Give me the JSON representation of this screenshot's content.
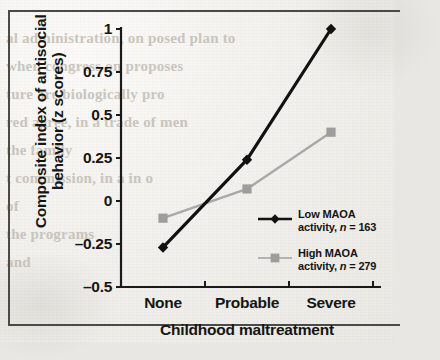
{
  "figure": {
    "background_color": "#f0efeb",
    "ink_color": "#111111",
    "series_colors": {
      "low": "#111111",
      "high": "#a8a8a8"
    }
  },
  "ghost_text": [
    {
      "text": "al administration, on posed plan to",
      "x": 6,
      "y": 30
    },
    {
      "text": "when congress on proposes",
      "x": 6,
      "y": 58
    },
    {
      "text": "ture are biologically pro",
      "x": 6,
      "y": 86
    },
    {
      "text": "red agree, in a trade of men",
      "x": 6,
      "y": 114
    },
    {
      "text": "the family",
      "x": 6,
      "y": 142
    },
    {
      "text": "t commission, in a in o",
      "x": 6,
      "y": 170
    },
    {
      "text": "of",
      "x": 6,
      "y": 198
    },
    {
      "text": "the programs",
      "x": 6,
      "y": 226
    },
    {
      "text": "and",
      "x": 6,
      "y": 254
    }
  ],
  "chart_data": {
    "type": "line",
    "title": "",
    "xlabel": "Childhood maltreatment",
    "ylabel": "Composite index of antisocial behavior (z scores)",
    "categories": [
      "None",
      "Probable",
      "Severe"
    ],
    "ytick_labels": [
      "1",
      "0.75",
      "0.5",
      "0.25",
      "0",
      "–0.25",
      "–0.5"
    ],
    "ytick_values": [
      1,
      0.75,
      0.5,
      0.25,
      0,
      -0.25,
      -0.5
    ],
    "ylim": [
      -0.5,
      1
    ],
    "grid": false,
    "legend_position": "inside-right",
    "series": [
      {
        "name": "Low MAOA activity",
        "legend_line1": "Low MAOA",
        "legend_line2_prefix": "activity, ",
        "legend_line2_italic": "n",
        "legend_line2_suffix": " = 163",
        "n": 163,
        "color": "#111111",
        "marker": "diamond",
        "values": [
          -0.27,
          0.24,
          1.0
        ]
      },
      {
        "name": "High MAOA activity",
        "legend_line1": "High MAOA",
        "legend_line2_prefix": "activity, ",
        "legend_line2_italic": "n",
        "legend_line2_suffix": " = 279",
        "n": 279,
        "color": "#a8a8a8",
        "marker": "square",
        "values": [
          -0.1,
          0.07,
          0.4
        ]
      }
    ]
  }
}
